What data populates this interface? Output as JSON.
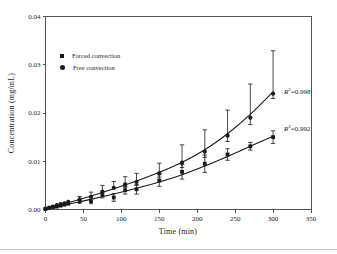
{
  "chart_data": {
    "type": "scatter",
    "title": "",
    "xlabel": "Time (min)",
    "ylabel": "Concentration (mg/mL)",
    "xlim": [
      0,
      350
    ],
    "ylim": [
      0,
      0.04
    ],
    "x_ticks": [
      0,
      50,
      100,
      150,
      200,
      250,
      300,
      350
    ],
    "x_tick_labels": [
      "0",
      "50",
      "100",
      "150",
      "200",
      "250",
      "300",
      "350"
    ],
    "y_ticks": [
      0,
      0.01,
      0.02,
      0.03,
      0.04
    ],
    "y_tick_labels": [
      "0.00",
      "0.01",
      "0.02",
      "0.03",
      "0.04"
    ],
    "grid": false,
    "legend_position": "upper-left-inside",
    "x": [
      0,
      5,
      10,
      15,
      20,
      25,
      30,
      45,
      60,
      75,
      90,
      105,
      120,
      150,
      180,
      210,
      240,
      270,
      300
    ],
    "series": [
      {
        "name": "Forced convection",
        "marker": "square",
        "r2": "0.992",
        "values": [
          0.0001,
          0.0003,
          0.0005,
          0.0006,
          0.0008,
          0.001,
          0.0012,
          0.0016,
          0.0016,
          0.003,
          0.0025,
          0.004,
          0.0042,
          0.006,
          0.0078,
          0.0095,
          0.0114,
          0.0131,
          0.015
        ],
        "errors": [
          0.0001,
          0.0001,
          0.0001,
          0.0002,
          0.0002,
          0.0002,
          0.0003,
          0.0004,
          0.0005,
          0.0006,
          0.0008,
          0.0008,
          0.001,
          0.0012,
          0.0015,
          0.0018,
          0.0012,
          0.0008,
          0.0013
        ],
        "fit": {
          "x": [
            0,
            30,
            60,
            90,
            120,
            150,
            180,
            210,
            240,
            270,
            300
          ],
          "y": [
            0.0001,
            0.0011,
            0.0021,
            0.0032,
            0.0044,
            0.0057,
            0.0072,
            0.009,
            0.011,
            0.0131,
            0.0152
          ]
        }
      },
      {
        "name": "Free convection",
        "marker": "circle",
        "r2": "0.998",
        "values": [
          0.0002,
          0.0004,
          0.0006,
          0.0009,
          0.0011,
          0.0013,
          0.0016,
          0.0021,
          0.0026,
          0.0037,
          0.0045,
          0.0052,
          0.0057,
          0.0075,
          0.0097,
          0.012,
          0.0153,
          0.019,
          0.024
        ],
        "errors_up": [
          0.0002,
          0.0002,
          0.0002,
          0.0003,
          0.0003,
          0.0004,
          0.0004,
          0.0006,
          0.001,
          0.0013,
          0.0013,
          0.0016,
          0.0018,
          0.0021,
          0.0037,
          0.0045,
          0.0053,
          0.007,
          0.0089
        ],
        "errors_down": [
          0.0001,
          0.0001,
          0.0001,
          0.0001,
          0.0002,
          0.0002,
          0.0002,
          0.0003,
          0.0004,
          0.0005,
          0.0005,
          0.0006,
          0.0007,
          0.0008,
          0.001,
          0.0012,
          0.0012,
          0.0014,
          0.001
        ],
        "fit": {
          "x": [
            0,
            30,
            60,
            90,
            120,
            150,
            180,
            210,
            240,
            270,
            300
          ],
          "y": [
            0.0002,
            0.0014,
            0.0028,
            0.0043,
            0.0059,
            0.0077,
            0.0098,
            0.0124,
            0.0157,
            0.0197,
            0.0244
          ]
        }
      }
    ],
    "colors": {
      "marker": "#1a1a1a",
      "line": "#1a1a1a",
      "frame": "#555555",
      "tick_text": "#222222"
    }
  },
  "annotations": [
    {
      "id": "r2-free",
      "prefix": "R",
      "sup": "2",
      "text": "=0.998"
    },
    {
      "id": "r2-forced",
      "prefix": "R",
      "sup": "2",
      "text": "=0.992"
    }
  ]
}
